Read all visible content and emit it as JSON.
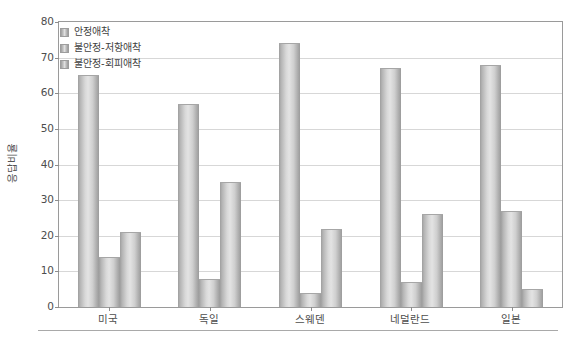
{
  "chart_data": {
    "type": "bar",
    "title": "",
    "subtitle": "",
    "xlabel": "",
    "ylabel": "응답비율",
    "ylim": [
      0,
      80
    ],
    "ytick_step": 10,
    "yticks": [
      "80",
      "70",
      "60",
      "50",
      "40",
      "30",
      "20",
      "10",
      "0"
    ],
    "grid": true,
    "legend_position": "top-left-inside",
    "categories": [
      "미국",
      "독일",
      "스웨덴",
      "네덜란드",
      "일본"
    ],
    "series": [
      {
        "name": "안정애착",
        "values": [
          65,
          57,
          74,
          67,
          68
        ]
      },
      {
        "name": "불안정-저항애착",
        "values": [
          14,
          8,
          4,
          7,
          27
        ]
      },
      {
        "name": "불안정-회피애착",
        "values": [
          21,
          35,
          22,
          26,
          5
        ]
      }
    ]
  },
  "colors": {
    "bar_light": "#e3e3e3",
    "bar_mid": "#c2c2c2",
    "bar_dark": "#9b9b9b",
    "grid": "#d7d7d7",
    "frame": "#9a9a9a",
    "text": "#4d4d4d"
  }
}
